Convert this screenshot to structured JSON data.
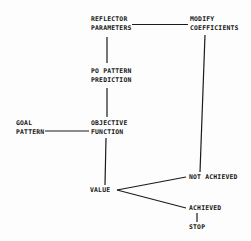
{
  "diagram": {
    "type": "flowchart",
    "nodes": {
      "reflector": {
        "line1": "REFLECTOR",
        "line2": "PARAMETERS"
      },
      "modify": {
        "line1": "MODIFY",
        "line2": "COEFFICIENTS"
      },
      "po_pattern": {
        "line1": "PO PATTERN",
        "line2": "PREDICTION"
      },
      "goal": {
        "line1": "GOAL",
        "line2": "PATTERN"
      },
      "objective": {
        "line1": "OBJECTIVE",
        "line2": "FUNCTION"
      },
      "value": {
        "label": "VALUE"
      },
      "not_achieved": {
        "label": "NOT ACHIEVED"
      },
      "achieved": {
        "label": "ACHIEVED"
      },
      "stop": {
        "label": "STOP"
      }
    },
    "edges": [
      {
        "from": "REFLECTOR PARAMETERS",
        "to": "MODIFY COEFFICIENTS"
      },
      {
        "from": "REFLECTOR PARAMETERS",
        "to": "PO PATTERN PREDICTION"
      },
      {
        "from": "PO PATTERN PREDICTION",
        "to": "OBJECTIVE FUNCTION"
      },
      {
        "from": "GOAL PATTERN",
        "to": "OBJECTIVE FUNCTION"
      },
      {
        "from": "OBJECTIVE FUNCTION",
        "to": "VALUE"
      },
      {
        "from": "VALUE",
        "to": "NOT ACHIEVED"
      },
      {
        "from": "VALUE",
        "to": "ACHIEVED"
      },
      {
        "from": "NOT ACHIEVED",
        "to": "MODIFY COEFFICIENTS"
      },
      {
        "from": "ACHIEVED",
        "to": "STOP"
      }
    ],
    "colors": {
      "ink": "#141414",
      "paper": "#fdfdfd"
    }
  }
}
